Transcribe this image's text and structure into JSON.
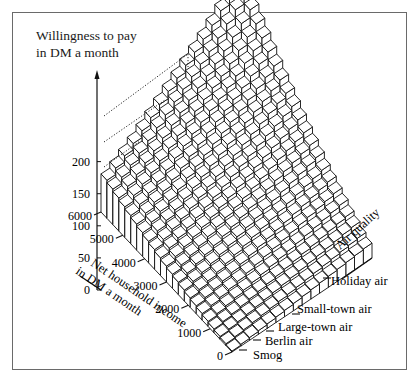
{
  "chart_data": {
    "type": "surface3d",
    "title": "Willingness to pay in DM a month",
    "title_lines": [
      "Willingness to pay",
      "in DM a month"
    ],
    "zlabel": "Willingness to pay in DM a month",
    "xlabel": "Net household income in DM a month",
    "xlabel_lines": [
      "Net household income",
      "in DM a month"
    ],
    "ylabel": "Air quality",
    "z_ticks": [
      0,
      50,
      100,
      150,
      200
    ],
    "z_tick_labels": [
      "0",
      "50",
      "100",
      "150",
      "200"
    ],
    "zlim": [
      0,
      250
    ],
    "x_ticks": [
      0,
      1000,
      2000,
      3000,
      4000,
      5000,
      6000
    ],
    "x_tick_labels": [
      "0",
      "1000",
      "2000",
      "3000",
      "4000",
      "5000",
      "6000"
    ],
    "xlim": [
      0,
      6000
    ],
    "y_categories": [
      "Smog",
      "Berlin air",
      "Large-town air",
      "Small-town air",
      "Holiday air"
    ],
    "grid": false,
    "legend": null,
    "surface_description": "Willingness to pay rises with both income and air quality; minimum near 0 at Smog / 0 DM income, maximum about 240 DM at Holiday air / 6000 DM income.",
    "approx_values": {
      "rows_air_quality": [
        "Smog",
        "Berlin air",
        "Large-town air",
        "Small-town air",
        "Holiday air"
      ],
      "cols_income": [
        0,
        1000,
        2000,
        3000,
        4000,
        5000,
        6000
      ],
      "z": [
        [
          0,
          5,
          12,
          20,
          30,
          42,
          55
        ],
        [
          5,
          15,
          28,
          42,
          58,
          75,
          95
        ],
        [
          10,
          25,
          45,
          65,
          90,
          115,
          140
        ],
        [
          15,
          35,
          60,
          90,
          120,
          150,
          185
        ],
        [
          20,
          45,
          75,
          110,
          150,
          195,
          240
        ]
      ]
    }
  }
}
